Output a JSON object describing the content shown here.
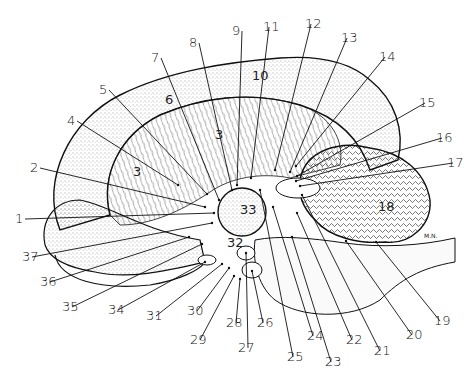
{
  "figure": {
    "signature": "M.N.",
    "region_labels": [
      {
        "text": "3",
        "x": 215,
        "y": 139
      },
      {
        "text": "3",
        "x": 133,
        "y": 176
      },
      {
        "text": "6",
        "x": 165,
        "y": 104
      },
      {
        "text": "10",
        "x": 252,
        "y": 80
      },
      {
        "text": "18",
        "x": 378,
        "y": 211
      },
      {
        "text": "33",
        "x": 240,
        "y": 214
      },
      {
        "text": "32",
        "x": 227,
        "y": 247
      }
    ],
    "callouts": [
      {
        "num": "1",
        "lx": 15,
        "ly": 214,
        "tx": 214,
        "ty": 213
      },
      {
        "num": "2",
        "lx": 30,
        "ly": 163,
        "tx": 205,
        "ty": 207
      },
      {
        "num": "3",
        "lx": 0,
        "ly": 0,
        "tx": 0,
        "ty": 0
      },
      {
        "num": "4",
        "lx": 67,
        "ly": 116,
        "tx": 178,
        "ty": 185
      },
      {
        "num": "5",
        "lx": 99,
        "ly": 85,
        "tx": 207,
        "ty": 194
      },
      {
        "num": "7",
        "lx": 151,
        "ly": 53,
        "tx": 219,
        "ty": 200
      },
      {
        "num": "8",
        "lx": 189,
        "ly": 38,
        "tx": 232,
        "ty": 190
      },
      {
        "num": "9",
        "lx": 232,
        "ly": 26,
        "tx": 237,
        "ty": 185
      },
      {
        "num": "11",
        "lx": 269,
        "ly": 22,
        "tx": 251,
        "ty": 178
      },
      {
        "num": "12",
        "lx": 311,
        "ly": 19,
        "tx": 275,
        "ty": 170
      },
      {
        "num": "13",
        "lx": 347,
        "ly": 33,
        "tx": 290,
        "ty": 172
      },
      {
        "num": "14",
        "lx": 385,
        "ly": 52,
        "tx": 296,
        "ty": 166
      },
      {
        "num": "15",
        "lx": 425,
        "ly": 98,
        "tx": 297,
        "ty": 176
      },
      {
        "num": "16",
        "lx": 442,
        "ly": 133,
        "tx": 296,
        "ty": 181
      },
      {
        "num": "17",
        "lx": 453,
        "ly": 158,
        "tx": 300,
        "ty": 186
      },
      {
        "num": "19",
        "lx": 440,
        "ly": 316,
        "tx": 376,
        "ty": 242
      },
      {
        "num": "20",
        "lx": 412,
        "ly": 330,
        "tx": 346,
        "ty": 241
      },
      {
        "num": "21",
        "lx": 380,
        "ly": 346,
        "tx": 302,
        "ty": 195
      },
      {
        "num": "22",
        "lx": 352,
        "ly": 335,
        "tx": 297,
        "ty": 213
      },
      {
        "num": "23",
        "lx": 331,
        "ly": 357,
        "tx": 292,
        "ty": 237
      },
      {
        "num": "24",
        "lx": 313,
        "ly": 331,
        "tx": 273,
        "ty": 207
      },
      {
        "num": "25",
        "lx": 293,
        "ly": 352,
        "tx": 260,
        "ty": 190
      },
      {
        "num": "26",
        "lx": 263,
        "ly": 318,
        "tx": 252,
        "ty": 271
      },
      {
        "num": "27",
        "lx": 238,
        "ly": 343,
        "tx": 246,
        "ty": 253
      },
      {
        "num": "28",
        "lx": 226,
        "ly": 318,
        "tx": 240,
        "ty": 279
      },
      {
        "num": "29",
        "lx": 190,
        "ly": 335,
        "tx": 234,
        "ty": 276
      },
      {
        "num": "30",
        "lx": 187,
        "ly": 306,
        "tx": 229,
        "ty": 268
      },
      {
        "num": "31",
        "lx": 146,
        "ly": 311,
        "tx": 222,
        "ty": 264
      },
      {
        "num": "34",
        "lx": 108,
        "ly": 305,
        "tx": 205,
        "ty": 262
      },
      {
        "num": "35",
        "lx": 62,
        "ly": 302,
        "tx": 202,
        "ty": 244
      },
      {
        "num": "36",
        "lx": 40,
        "ly": 277,
        "tx": 189,
        "ty": 237
      },
      {
        "num": "37",
        "lx": 22,
        "ly": 252,
        "tx": 212,
        "ty": 223
      }
    ]
  },
  "colors": {
    "ink": "#111111",
    "background": "#ffffff",
    "stipple": "#555555"
  }
}
